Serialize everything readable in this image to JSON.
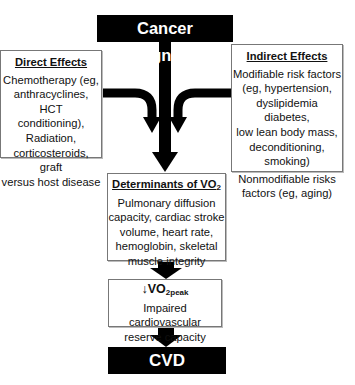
{
  "diagram": {
    "top": {
      "label": "Cancer Diagnosis"
    },
    "direct_effects": {
      "title": "Direct Effects",
      "lines": [
        "Chemotherapy (eg,",
        "anthracyclines, HCT",
        "conditioning),",
        "Radiation,",
        "corticosteroids, graft",
        "versus host disease"
      ]
    },
    "indirect_effects": {
      "title": "Indirect Effects",
      "modifiable_lines": [
        "Modifiable risk factors",
        "(eg, hypertension,",
        "dyslipidemia diabetes,",
        "low lean body mass,",
        "deconditioning,",
        "smoking)"
      ],
      "nonmodifiable_lines": [
        "Nonmodifiable risks",
        "factors (eg, aging)"
      ]
    },
    "determinants": {
      "title_main": "Determinants of VO",
      "title_sub": "2",
      "lines": [
        "Pulmonary diffusion",
        "capacity, cardiac stroke",
        "volume, heart rate,",
        "hemoglobin, skeletal",
        "muscle integrity"
      ]
    },
    "vo2peak": {
      "arrow_symbol": "↓",
      "title_main": "VO",
      "title_sub": "2peak",
      "lines": [
        "Impaired cardiovascular",
        "reserve capacity"
      ]
    },
    "bottom": {
      "label": "CVD"
    },
    "colors": {
      "arrow": "#000000",
      "box_border": "#777777",
      "dark_box": "#000000"
    }
  }
}
